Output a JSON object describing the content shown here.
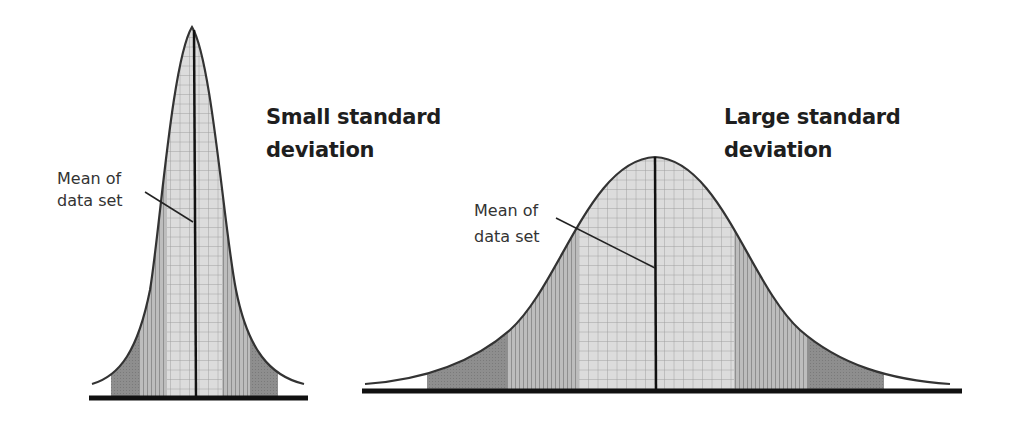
{
  "diagram": {
    "panels": [
      {
        "id": "small",
        "title_line1": "Small standard",
        "title_line2": "deviation",
        "mean_label_line1": "Mean of",
        "mean_label_line2": "data set"
      },
      {
        "id": "large",
        "title_line1": "Large standard",
        "title_line2": "deviation",
        "mean_label_line1": "Mean of",
        "mean_label_line2": "data set"
      }
    ]
  },
  "colors": {
    "outer_band": "#8a8a8a",
    "middle_band": "#b3b3b3",
    "inner_band": "#d9d9d9",
    "curve": "#333333",
    "axis": "#111111",
    "text": "#1e1e1e"
  }
}
